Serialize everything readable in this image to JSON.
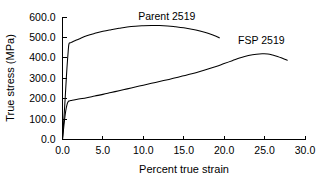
{
  "chart_data": {
    "type": "line",
    "title": "",
    "xlabel": "Percent true strain",
    "ylabel": "True stress (MPa)",
    "xlim": [
      0.0,
      30.0
    ],
    "ylim": [
      0.0,
      600.0
    ],
    "xticks": [
      "0.0",
      "5.0",
      "10.0",
      "15.0",
      "20.0",
      "25.0",
      "30.0"
    ],
    "yticks": [
      "0.0",
      "100.0",
      "200.0",
      "300.0",
      "400.0",
      "500.0",
      "600.0"
    ],
    "xtick_values": [
      0,
      5,
      10,
      15,
      20,
      25,
      30
    ],
    "ytick_values": [
      0,
      100,
      200,
      300,
      400,
      500,
      600
    ],
    "grid": false,
    "legend_position": "inline-annotation",
    "line_color": "#000000",
    "background_color": "#ffffff",
    "series": [
      {
        "name": "Parent 2519",
        "label_x": 12.9,
        "label_y": 583,
        "x": [
          0.0,
          0.1,
          0.25,
          0.4,
          0.55,
          0.7,
          0.8,
          0.95,
          1.2,
          1.6,
          2.2,
          3.0,
          4.0,
          5.0,
          6.0,
          7.0,
          8.0,
          9.0,
          10.0,
          11.0,
          12.0,
          13.0,
          14.0,
          15.0,
          16.0,
          17.0,
          18.0,
          19.0,
          19.4
        ],
        "y": [
          0,
          60,
          150,
          250,
          350,
          430,
          468,
          473,
          478,
          485,
          495,
          508,
          520,
          530,
          538,
          545,
          551,
          555,
          557,
          558,
          558,
          556,
          552,
          547,
          540,
          531,
          520,
          506,
          498
        ]
      },
      {
        "name": "FSP 2519",
        "label_x": 24.6,
        "label_y": 466,
        "x": [
          0.0,
          0.1,
          0.25,
          0.4,
          0.55,
          0.7,
          0.85,
          1.2,
          2.0,
          3.0,
          4.0,
          5.0,
          6.0,
          7.0,
          8.0,
          9.0,
          10.0,
          11.0,
          12.0,
          13.0,
          14.0,
          15.0,
          16.0,
          17.0,
          18.0,
          19.0,
          20.0,
          21.0,
          22.0,
          23.0,
          24.0,
          24.8,
          25.4,
          26.0,
          26.6,
          27.2,
          27.8
        ],
        "y": [
          0,
          40,
          95,
          140,
          170,
          185,
          189,
          192,
          198,
          205,
          213,
          221,
          230,
          239,
          248,
          257,
          266,
          275,
          284,
          293,
          302,
          312,
          322,
          333,
          345,
          358,
          372,
          386,
          400,
          411,
          418,
          420,
          419,
          414,
          407,
          398,
          388
        ]
      }
    ]
  }
}
